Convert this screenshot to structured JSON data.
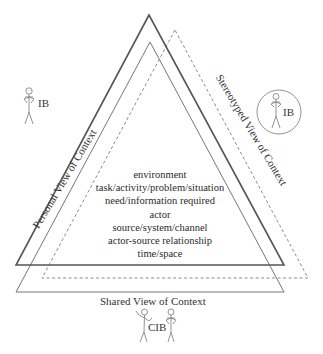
{
  "diagram": {
    "type": "triangle-overlap",
    "colors": {
      "personal_triangle": "#555555",
      "shared_triangle": "#777777",
      "stereotyped_triangle": "#8a8a8a",
      "text": "#2a2a2a"
    },
    "triangles": {
      "personal": {
        "label": "Personal View of Context",
        "style": "solid-thick"
      },
      "shared": {
        "label": "Shared View of Context",
        "style": "solid-thin"
      },
      "stereotyped": {
        "label": "Stereotyped View of Context",
        "style": "dashed"
      }
    },
    "center_items": [
      "environment",
      "task/activity/problem/situation",
      "need/information required",
      "actor",
      "source/system/channel",
      "actor-source relationship",
      "time/space"
    ],
    "figures": {
      "left": {
        "label": "IB",
        "description": "stick figure, personal view"
      },
      "right": {
        "label": "IB",
        "description": "stick figure in circle, stereotyped view"
      },
      "bottom": {
        "label": "CIB",
        "description": "two stick figures, shared view"
      }
    }
  }
}
